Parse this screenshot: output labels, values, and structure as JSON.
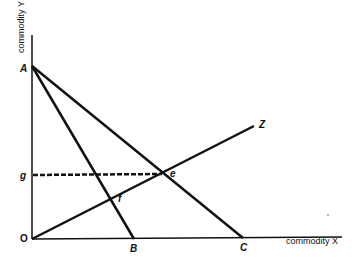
{
  "axes": {
    "y_title": "commodity Y",
    "x_title": "commodity X"
  },
  "points": {
    "A": "A",
    "B": "B",
    "C": "C",
    "Z": "Z",
    "e": "e",
    "f": "f",
    "g": "g",
    "O": "O"
  },
  "lines": [
    {
      "name": "AB",
      "from": "A",
      "to": "B"
    },
    {
      "name": "AC",
      "from": "A",
      "to": "C"
    },
    {
      "name": "OZ",
      "from": "O",
      "to": "Z"
    },
    {
      "name": "ge",
      "from": "g",
      "to": "e",
      "style": "dashed"
    }
  ]
}
